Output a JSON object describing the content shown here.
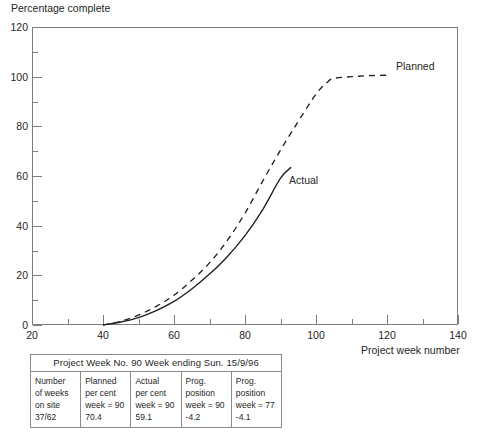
{
  "chart_data": {
    "type": "line",
    "title": "",
    "ylabel": "Percentage complete",
    "xlabel": "Project week number",
    "xlim": [
      20,
      140
    ],
    "ylim": [
      0,
      120
    ],
    "xticks": [
      20,
      40,
      60,
      80,
      100,
      120,
      140
    ],
    "yticks": [
      0,
      20,
      40,
      60,
      80,
      100,
      120
    ],
    "xminor": [
      30,
      50,
      70,
      90,
      110,
      130
    ],
    "yminor": [
      10,
      30,
      50,
      70,
      90,
      110
    ],
    "grid": false,
    "legend_position": "inline-annotation",
    "series": [
      {
        "name": "Planned",
        "style": "dashed",
        "x": [
          40,
          45,
          50,
          55,
          60,
          65,
          70,
          75,
          80,
          85,
          90,
          95,
          100,
          103,
          105,
          110,
          115,
          120
        ],
        "y": [
          0,
          1.5,
          4,
          7.5,
          12,
          18,
          25,
          34,
          45,
          58,
          70.4,
          82,
          93,
          97.5,
          99.3,
          100,
          100.4,
          100.6
        ]
      },
      {
        "name": "Actual",
        "style": "solid",
        "x": [
          40,
          45,
          50,
          55,
          60,
          65,
          70,
          75,
          80,
          85,
          90,
          93
        ],
        "y": [
          0,
          1.2,
          3,
          5.8,
          9.5,
          14.5,
          20.5,
          27.5,
          36,
          46.5,
          59.1,
          63.5
        ]
      }
    ],
    "annotations": [
      {
        "text": "Planned",
        "x": 125,
        "y": 101
      },
      {
        "text": "Actual",
        "x": 93,
        "y": 62
      }
    ]
  },
  "axes": {
    "y_labels": [
      "120",
      "100",
      "80",
      "60",
      "40",
      "20",
      "0"
    ],
    "x_labels": [
      "20",
      "40",
      "60",
      "80",
      "100",
      "120",
      "140"
    ],
    "y_axis_title": "Percentage complete",
    "x_axis_title": "Project week number"
  },
  "series_labels": {
    "planned": "Planned",
    "actual": "Actual"
  },
  "table": {
    "header": "Project Week No. 90 Week ending Sun. 15/9/96",
    "columns": [
      {
        "lines": [
          "Number",
          "of weeks",
          "on site",
          "37/62"
        ]
      },
      {
        "lines": [
          "Planned",
          "per cent",
          "week = 90",
          "70.4"
        ]
      },
      {
        "lines": [
          "Actual",
          "per cent",
          "week = 90",
          "59.1"
        ]
      },
      {
        "lines": [
          "Prog.",
          "position",
          "week = 90",
          "-4.2"
        ]
      },
      {
        "lines": [
          "Prog.",
          "position",
          "week = 77",
          "-4.1"
        ]
      }
    ]
  },
  "colors": {
    "line": "#1f1f1f",
    "axis": "#7d7d7d",
    "text": "#262626",
    "background": "#ffffff"
  }
}
